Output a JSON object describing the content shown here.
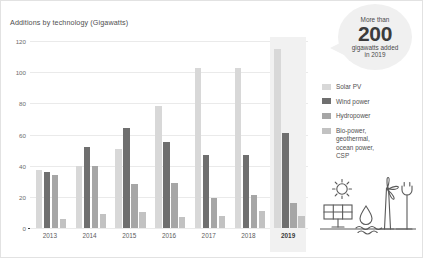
{
  "chart_data": {
    "type": "bar",
    "title": "Additions by technology (Gigawatts)",
    "xlabel": "",
    "ylabel": "Gigawatts",
    "ylim": [
      0,
      120
    ],
    "yticks": [
      0,
      20,
      40,
      60,
      80,
      100,
      120
    ],
    "grid": true,
    "legend_position": "right",
    "categories": [
      "2013",
      "2014",
      "2015",
      "2016",
      "2017",
      "2018",
      "2019"
    ],
    "highlighted_category": "2019",
    "series": [
      {
        "name": "Solar PV",
        "color": "#d8d8d8",
        "values": [
          37,
          40,
          51,
          78,
          103,
          103,
          115
        ]
      },
      {
        "name": "Wind power",
        "color": "#6f6f6f",
        "values": [
          36,
          52,
          64,
          55,
          47,
          47,
          61
        ]
      },
      {
        "name": "Hydropower",
        "color": "#a6a6a6",
        "values": [
          34,
          40,
          28,
          29,
          19,
          21,
          16
        ]
      },
      {
        "name": "Bio-power,\ngeothermal,\nocean power,\nCSP",
        "color": "#c2c2c2",
        "values": [
          6,
          9,
          10,
          7,
          8,
          11,
          8
        ]
      }
    ]
  },
  "callout": {
    "line1": "More than",
    "number": "200",
    "line3": "gigawatts added",
    "line4": "in 2019"
  },
  "icons": {
    "sun": "sun-icon",
    "solar_panel": "solar-panel-icon",
    "water_drop": "water-drop-icon",
    "waves": "waves-icon",
    "wind_turbine": "wind-turbine-icon",
    "plug": "power-plug-icon"
  }
}
